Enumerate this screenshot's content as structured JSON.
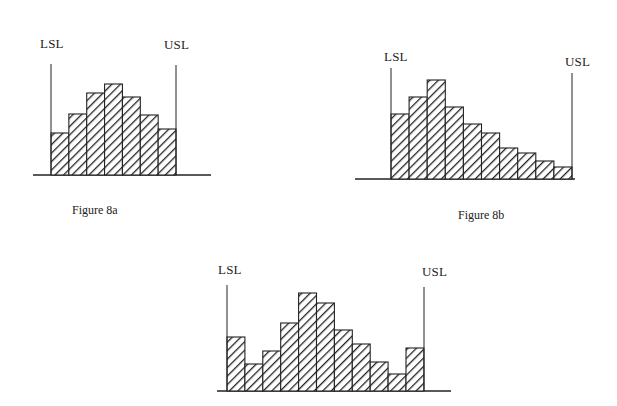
{
  "chart_data": [
    {
      "type": "bar",
      "title": "Figure 8a",
      "subtype": "histogram",
      "annotations": [
        "LSL",
        "USL"
      ],
      "categories": [
        "1",
        "2",
        "3",
        "4",
        "5",
        "6",
        "7"
      ],
      "values": [
        42,
        61,
        82,
        91,
        78,
        60,
        46
      ],
      "xlabel": "",
      "ylabel": "",
      "grid": false,
      "layout": {
        "lsl_x": 51,
        "usl_x": 176,
        "baseline_y": 175,
        "axis_x0": 33,
        "axis_x1": 211,
        "bar_x0": 51,
        "bar_w": 17.86,
        "lsl_top": 64,
        "usl_top": 65,
        "lsl_label": [
          40,
          49
        ],
        "usl_label": [
          164,
          50
        ],
        "caption": [
          88,
          216
        ]
      }
    },
    {
      "type": "bar",
      "title": "Figure 8b",
      "subtype": "histogram",
      "annotations": [
        "LSL",
        "USL"
      ],
      "categories": [
        "1",
        "2",
        "3",
        "4",
        "5",
        "6",
        "7",
        "8",
        "9",
        "10"
      ],
      "values": [
        65,
        82,
        99,
        72,
        55,
        46,
        31,
        26,
        18,
        12
      ],
      "xlabel": "",
      "ylabel": "",
      "grid": false,
      "layout": {
        "lsl_x": 391,
        "usl_x": 572,
        "baseline_y": 179,
        "axis_x0": 355,
        "axis_x1": 575,
        "bar_x0": 391,
        "bar_w": 18.1,
        "lsl_top": 68,
        "usl_top": 73,
        "lsl_label": [
          384,
          62
        ],
        "usl_label": [
          565,
          67
        ],
        "caption": [
          458,
          221
        ]
      }
    },
    {
      "type": "bar",
      "title": "",
      "subtype": "histogram",
      "annotations": [
        "LSL",
        "USL"
      ],
      "categories": [
        "1",
        "2",
        "3",
        "4",
        "5",
        "6",
        "7",
        "8",
        "9",
        "10",
        "11"
      ],
      "values": [
        54,
        27,
        40,
        68,
        98,
        88,
        61,
        47,
        29,
        17,
        43
      ],
      "xlabel": "",
      "ylabel": "",
      "grid": false,
      "layout": {
        "lsl_x": 227,
        "usl_x": 424,
        "baseline_y": 391,
        "axis_x0": 217,
        "axis_x1": 451,
        "bar_x0": 227,
        "bar_w": 17.9,
        "lsl_top": 285,
        "usl_top": 287,
        "lsl_label": [
          218,
          275
        ],
        "usl_label": [
          422,
          277
        ],
        "caption": null
      }
    }
  ],
  "labels": {
    "lsl": "LSL",
    "usl": "USL",
    "fig_a_caption": "Figure 8a",
    "fig_b_caption": "Figure 8b"
  },
  "colors": {
    "ink": "#222222",
    "hatch": "#222222",
    "background": "#ffffff"
  }
}
